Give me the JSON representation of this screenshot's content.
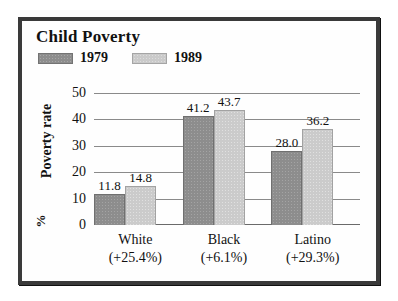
{
  "chart_data": {
    "type": "bar",
    "title": "Child Poverty",
    "xlabel": "",
    "ylabel": "Poverty rate",
    "yunit": "%",
    "ylim": [
      0,
      50
    ],
    "yticks": [
      50,
      40,
      30,
      20,
      10,
      0
    ],
    "grid": true,
    "legend_position": "top-left",
    "categories": [
      "White",
      "Black",
      "Latino"
    ],
    "category_deltas": [
      "(+25.4%)",
      "(+6.1%)",
      "(+29.3%)"
    ],
    "series": [
      {
        "name": "1979",
        "color": "#8d8d8d",
        "values": [
          11.8,
          41.2,
          28.0
        ],
        "labels": [
          "11.8",
          "41.2",
          "28.0"
        ]
      },
      {
        "name": "1989",
        "color": "#cbcbcb",
        "values": [
          14.8,
          43.7,
          36.2
        ],
        "labels": [
          "14.8",
          "43.7",
          "36.2"
        ]
      }
    ]
  },
  "legend": {
    "items": [
      {
        "label": "1979",
        "swatch": "legend-swatch-1979"
      },
      {
        "label": "1989",
        "swatch": "legend-swatch-1989"
      }
    ]
  },
  "axis": {
    "y_title": "Poverty rate",
    "y_unit": "%",
    "ticks": [
      "50",
      "40",
      "30",
      "20",
      "10",
      "0"
    ]
  }
}
